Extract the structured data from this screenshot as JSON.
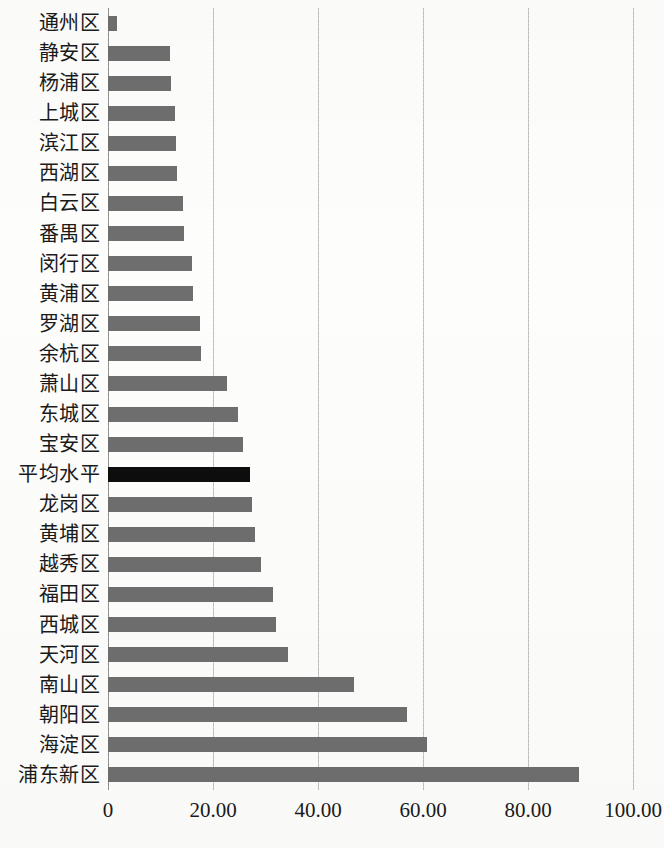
{
  "chart_data": {
    "type": "bar",
    "orientation": "horizontal",
    "title": "",
    "subtitle": "",
    "xlabel": "",
    "ylabel": "",
    "xlim": [
      0,
      100
    ],
    "ylim": null,
    "grid": true,
    "legend": null,
    "xticks": [
      "0",
      "20.00",
      "40.00",
      "60.00",
      "80.00",
      "100.00"
    ],
    "xtick_values": [
      0,
      20,
      40,
      60,
      80,
      100
    ],
    "categories": [
      "通州区",
      "静安区",
      "杨浦区",
      "上城区",
      "滨江区",
      "西湖区",
      "白云区",
      "番禺区",
      "闵行区",
      "黄浦区",
      "罗湖区",
      "余杭区",
      "萧山区",
      "东城区",
      "宝安区",
      "平均水平",
      "龙岗区",
      "黄埔区",
      "越秀区",
      "福田区",
      "西城区",
      "天河区",
      "南山区",
      "朝阳区",
      "海淀区",
      "浦东新区"
    ],
    "values": [
      1.7,
      11.9,
      12.0,
      12.8,
      13.0,
      13.1,
      14.3,
      14.4,
      16.0,
      16.2,
      17.5,
      17.7,
      22.7,
      24.8,
      25.7,
      27.0,
      27.4,
      28.0,
      29.1,
      31.4,
      32.0,
      34.3,
      46.9,
      56.9,
      60.8,
      89.7
    ],
    "highlight_category": "平均水平",
    "colors": {
      "bar": "#6e6e6e",
      "highlight_bar": "#0d0d0d",
      "gridline": "#c9c9c9",
      "axis": "#9a9a9a",
      "text": "#1a1a1a",
      "background": "#fdfdfc"
    }
  }
}
